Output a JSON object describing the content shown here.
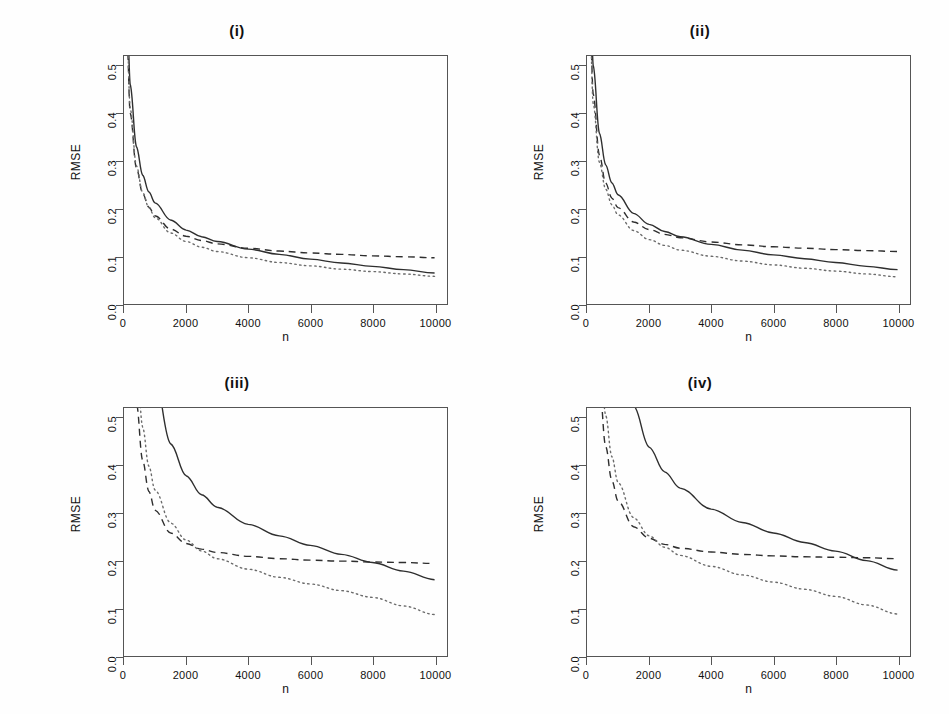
{
  "figure": {
    "panel_count": 4,
    "shared_xlabel": "n",
    "shared_ylabel": "RMSE"
  },
  "axes": {
    "xticks": [
      "0",
      "2000",
      "4000",
      "6000",
      "8000",
      "10000"
    ],
    "xtick_values": [
      0,
      2000,
      4000,
      6000,
      8000,
      10000
    ],
    "yticks": [
      "0.0",
      "0.1",
      "0.2",
      "0.3",
      "0.4",
      "0.5"
    ],
    "ytick_values": [
      0.0,
      0.1,
      0.2,
      0.3,
      0.4,
      0.5
    ],
    "xlim": [
      0,
      10400
    ],
    "ylim": [
      0.0,
      0.52
    ]
  },
  "titles": {
    "p1": "(i)",
    "p2": "(ii)",
    "p3": "(iii)",
    "p4": "(iv)"
  },
  "labels": {
    "x": "n",
    "y": "RMSE"
  },
  "colors": {
    "solid": "#2e2e2e",
    "dashed": "#2e2e2e",
    "dotted": "#6b6b6b",
    "frame": "#555555",
    "background": "#fefefe"
  },
  "chart_data": [
    {
      "type": "line",
      "title": "(i)",
      "xlabel": "n",
      "ylabel": "RMSE",
      "xlim": [
        0,
        10400
      ],
      "ylim": [
        0.0,
        0.52
      ],
      "grid": false,
      "legend": "none",
      "x": [
        100,
        200,
        400,
        600,
        800,
        1000,
        1500,
        2000,
        2500,
        3000,
        4000,
        5000,
        6000,
        7000,
        8000,
        9000,
        10000
      ],
      "series": [
        {
          "name": "solid",
          "style": "solid",
          "values": [
            0.62,
            0.46,
            0.33,
            0.27,
            0.235,
            0.212,
            0.176,
            0.155,
            0.141,
            0.131,
            0.115,
            0.104,
            0.094,
            0.086,
            0.079,
            0.072,
            0.065
          ]
        },
        {
          "name": "dashed",
          "style": "dashed",
          "values": [
            0.55,
            0.4,
            0.285,
            0.232,
            0.203,
            0.185,
            0.157,
            0.142,
            0.133,
            0.126,
            0.117,
            0.111,
            0.107,
            0.104,
            0.101,
            0.099,
            0.097
          ]
        },
        {
          "name": "dotted",
          "style": "dotted",
          "values": [
            0.56,
            0.41,
            0.29,
            0.234,
            0.202,
            0.181,
            0.149,
            0.131,
            0.119,
            0.11,
            0.097,
            0.087,
            0.08,
            0.073,
            0.068,
            0.063,
            0.058
          ]
        }
      ]
    },
    {
      "type": "line",
      "title": "(ii)",
      "xlabel": "n",
      "ylabel": "RMSE",
      "xlim": [
        0,
        10400
      ],
      "ylim": [
        0.0,
        0.52
      ],
      "grid": false,
      "legend": "none",
      "x": [
        100,
        200,
        400,
        600,
        800,
        1000,
        1500,
        2000,
        2500,
        3000,
        4000,
        5000,
        6000,
        7000,
        8000,
        9000,
        10000
      ],
      "series": [
        {
          "name": "solid",
          "style": "solid",
          "values": [
            0.68,
            0.5,
            0.358,
            0.292,
            0.254,
            0.229,
            0.19,
            0.167,
            0.152,
            0.141,
            0.125,
            0.113,
            0.103,
            0.095,
            0.087,
            0.079,
            0.072
          ]
        },
        {
          "name": "dashed",
          "style": "dashed",
          "values": [
            0.6,
            0.44,
            0.312,
            0.254,
            0.222,
            0.202,
            0.172,
            0.156,
            0.146,
            0.139,
            0.13,
            0.124,
            0.12,
            0.117,
            0.114,
            0.112,
            0.11
          ]
        },
        {
          "name": "dotted",
          "style": "dotted",
          "values": [
            0.58,
            0.42,
            0.297,
            0.241,
            0.208,
            0.187,
            0.154,
            0.135,
            0.123,
            0.113,
            0.1,
            0.09,
            0.082,
            0.075,
            0.069,
            0.063,
            0.057
          ]
        }
      ]
    },
    {
      "type": "line",
      "title": "(iii)",
      "xlabel": "n",
      "ylabel": "RMSE",
      "xlim": [
        0,
        10400
      ],
      "ylim": [
        0.0,
        0.52
      ],
      "grid": false,
      "legend": "none",
      "x": [
        200,
        400,
        600,
        800,
        1000,
        1500,
        2000,
        2500,
        3000,
        4000,
        5000,
        6000,
        7000,
        8000,
        9000,
        10000
      ],
      "series": [
        {
          "name": "solid",
          "style": "solid",
          "values": [
            1.55,
            1.1,
            0.85,
            0.68,
            0.58,
            0.445,
            0.378,
            0.338,
            0.312,
            0.276,
            0.252,
            0.232,
            0.213,
            0.196,
            0.178,
            0.16
          ]
        },
        {
          "name": "dashed",
          "style": "dashed",
          "values": [
            0.8,
            0.53,
            0.41,
            0.345,
            0.306,
            0.258,
            0.236,
            0.224,
            0.217,
            0.209,
            0.204,
            0.201,
            0.199,
            0.197,
            0.196,
            0.194
          ]
        },
        {
          "name": "dotted",
          "style": "dotted",
          "values": [
            0.95,
            0.63,
            0.48,
            0.398,
            0.348,
            0.279,
            0.243,
            0.22,
            0.204,
            0.182,
            0.165,
            0.151,
            0.137,
            0.123,
            0.105,
            0.087
          ]
        }
      ]
    },
    {
      "type": "line",
      "title": "(iv)",
      "xlabel": "n",
      "ylabel": "RMSE",
      "xlim": [
        0,
        10400
      ],
      "ylim": [
        0.0,
        0.52
      ],
      "grid": false,
      "legend": "none",
      "x": [
        200,
        400,
        600,
        800,
        1000,
        1500,
        2000,
        2500,
        3000,
        4000,
        5000,
        6000,
        7000,
        8000,
        9000,
        10000
      ],
      "series": [
        {
          "name": "solid",
          "style": "solid",
          "values": [
            1.85,
            1.32,
            1.02,
            0.82,
            0.695,
            0.525,
            0.438,
            0.386,
            0.352,
            0.308,
            0.28,
            0.258,
            0.238,
            0.22,
            0.2,
            0.18
          ]
        },
        {
          "name": "dashed",
          "style": "dashed",
          "values": [
            0.86,
            0.57,
            0.44,
            0.368,
            0.325,
            0.271,
            0.247,
            0.234,
            0.226,
            0.218,
            0.213,
            0.21,
            0.208,
            0.207,
            0.206,
            0.204
          ]
        },
        {
          "name": "dotted",
          "style": "dotted",
          "values": [
            1.0,
            0.66,
            0.505,
            0.418,
            0.364,
            0.29,
            0.252,
            0.228,
            0.211,
            0.188,
            0.17,
            0.155,
            0.14,
            0.125,
            0.107,
            0.088
          ]
        }
      ]
    }
  ]
}
